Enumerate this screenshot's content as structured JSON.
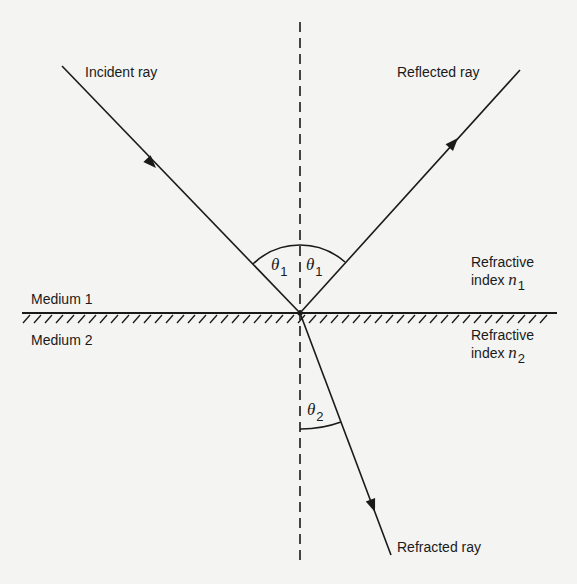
{
  "diagram": {
    "rays": {
      "incident": {
        "label": "Incident ray"
      },
      "reflected": {
        "label": "Reflected ray"
      },
      "refracted": {
        "label": "Refracted ray"
      }
    },
    "media": {
      "upper": {
        "label": "Medium 1"
      },
      "lower": {
        "label": "Medium 2"
      }
    },
    "indices": {
      "upper": {
        "line1": "Refractive",
        "prefix": "index ",
        "symbol": "n",
        "subscript": "1"
      },
      "lower": {
        "line1": "Refractive",
        "prefix": "index ",
        "symbol": "n",
        "subscript": "2"
      }
    },
    "angles": {
      "incidence": {
        "symbol": "θ",
        "subscript": "1"
      },
      "reflection": {
        "symbol": "θ",
        "subscript": "1"
      },
      "refraction": {
        "symbol": "θ",
        "subscript": "2"
      }
    },
    "colors": {
      "ink": "#1a1a1a",
      "paper": "#f4f4f2"
    }
  }
}
